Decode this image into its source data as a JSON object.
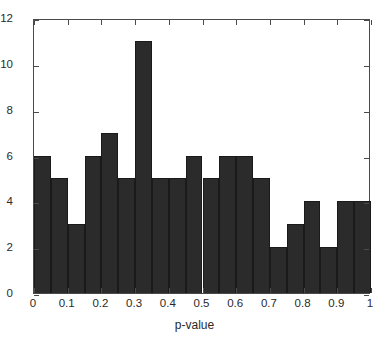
{
  "chart_data": {
    "type": "bar",
    "title": "",
    "subtitle": "",
    "xlabel": "p-value",
    "ylabel": "",
    "xlim": [
      0,
      1
    ],
    "ylim": [
      0,
      12
    ],
    "grid": false,
    "legend": null,
    "bin_width": 0.05,
    "bin_edges": [
      0,
      0.05,
      0.1,
      0.15,
      0.2,
      0.25,
      0.3,
      0.35,
      0.4,
      0.45,
      0.5,
      0.55,
      0.6,
      0.65,
      0.7,
      0.75,
      0.8,
      0.85,
      0.9,
      0.95,
      1.0
    ],
    "categories": [
      "0-0.05",
      "0.05-0.1",
      "0.1-0.15",
      "0.15-0.2",
      "0.2-0.25",
      "0.25-0.3",
      "0.3-0.35",
      "0.35-0.4",
      "0.4-0.45",
      "0.45-0.5",
      "0.5-0.55",
      "0.55-0.6",
      "0.6-0.65",
      "0.65-0.7",
      "0.7-0.75",
      "0.75-0.8",
      "0.8-0.85",
      "0.85-0.9",
      "0.9-0.95",
      "0.95-1.0"
    ],
    "values": [
      6,
      5,
      3,
      6,
      7,
      5,
      11,
      5,
      5,
      6,
      5,
      6,
      6,
      5,
      2,
      3,
      4,
      2,
      4,
      4
    ],
    "xticks": [
      0,
      0.1,
      0.2,
      0.3,
      0.4,
      0.5,
      0.6,
      0.7,
      0.8,
      0.9,
      1
    ],
    "xtick_labels": [
      "0",
      "0.1",
      "0.2",
      "0.3",
      "0.4",
      "0.5",
      "0.6",
      "0.7",
      "0.8",
      "0.9",
      "1"
    ],
    "yticks": [
      0,
      2,
      4,
      6,
      8,
      10,
      12
    ],
    "ytick_labels": [
      "0",
      "2",
      "4",
      "6",
      "8",
      "10",
      "12"
    ],
    "bar_color": "#2b2b2b",
    "bar_edge_color": "#1a1a1a",
    "axis_color": "#4a4a4a",
    "background_color": "#ffffff"
  }
}
